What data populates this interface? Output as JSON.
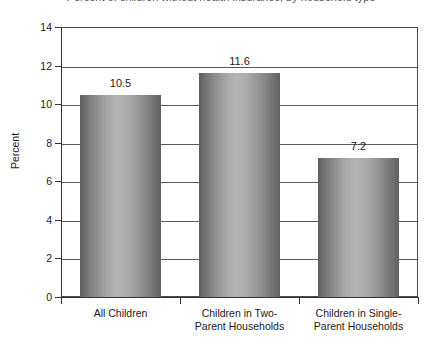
{
  "chart_data": {
    "type": "bar",
    "title": "Percent of children without health insurance, by household type",
    "subtitle": "",
    "xlabel": "",
    "ylabel": "Percent",
    "categories": [
      "All Children",
      "Children in Two-\nParent Households",
      "Children in Single-\nParent Households"
    ],
    "values": [
      10.5,
      11.6,
      7.2
    ],
    "value_labels": [
      "10.5",
      "11.6",
      "7.2"
    ],
    "ylim": [
      0,
      14
    ],
    "ytick_labels": [
      "0",
      "2",
      "4",
      "6",
      "8",
      "10",
      "12",
      "14"
    ],
    "ytick_values": [
      0,
      2,
      4,
      6,
      8,
      10,
      12,
      14
    ],
    "grid": true,
    "legend": "none",
    "bar_color_dark": "#5d5d5d",
    "bar_color_light": "#b4b4b4",
    "axis_color": "#333333",
    "plot_background": "#ffffff"
  }
}
